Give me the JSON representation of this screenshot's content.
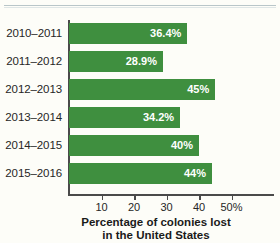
{
  "chart_data": {
    "type": "bar",
    "orientation": "horizontal",
    "title": "",
    "categories": [
      "2010–2011",
      "2011–2012",
      "2012–2013",
      "2013–2014",
      "2014–2015",
      "2015–2016"
    ],
    "values": [
      36.4,
      28.9,
      45,
      34.2,
      40,
      44
    ],
    "data_labels": [
      "36.4%",
      "28.9%",
      "45%",
      "34.2%",
      "40%",
      "44%"
    ],
    "xlabel_lines": [
      "Percentage of colonies lost",
      "in the United States"
    ],
    "ylabel": "",
    "xlim": [
      0,
      52
    ],
    "xticks": [
      10,
      20,
      30,
      40,
      50
    ],
    "xtick_labels": [
      "10",
      "20",
      "30",
      "40",
      "50%"
    ],
    "grid": false,
    "legend": false,
    "bar_color": "#3f8f3f",
    "label_color": "#ffffff",
    "axis_color": "#4a4a4a",
    "background": "#fdfdf8"
  }
}
